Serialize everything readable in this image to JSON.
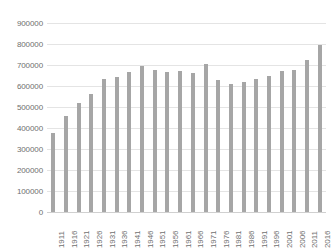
{
  "chart_data": {
    "type": "bar",
    "title": "",
    "subtitle": "",
    "xlabel": "",
    "ylabel": "",
    "grid": true,
    "legend": false,
    "legend_position": "none",
    "bar_color": "#a6a6a6",
    "axis_text_color": "#6f6f6f",
    "gridline_color": "#e4e4e4",
    "ylim": [
      0,
      900000
    ],
    "ytick_step": 100000,
    "ytick_labels": [
      "0",
      "100000",
      "200000",
      "300000",
      "400000",
      "500000",
      "600000",
      "700000",
      "800000",
      "900000"
    ],
    "ytick_values": [
      0,
      100000,
      200000,
      300000,
      400000,
      500000,
      600000,
      700000,
      800000,
      900000
    ],
    "categories": [
      "1911",
      "1916",
      "1921",
      "1926",
      "1931",
      "1936",
      "1941",
      "1946",
      "1951",
      "1956",
      "1961",
      "1966",
      "1971",
      "1976",
      "1981",
      "1986",
      "1991",
      "1996",
      "2001",
      "2006",
      "2011",
      "2016"
    ],
    "values": [
      375000,
      455000,
      520000,
      560000,
      632000,
      645000,
      665000,
      695000,
      675000,
      665000,
      670000,
      662000,
      705000,
      630000,
      610000,
      618000,
      635000,
      648000,
      673000,
      678000,
      723000,
      795000
    ]
  }
}
